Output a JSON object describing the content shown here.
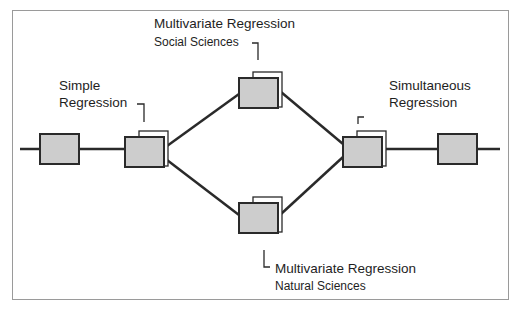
{
  "diagram": {
    "type": "flow-diagram",
    "labels": {
      "simple": {
        "line1": "Simple",
        "line2": "Regression"
      },
      "multivariate_social": {
        "line1": "Multivariate Regression",
        "line2": "Social Sciences"
      },
      "multivariate_natural": {
        "line1": "Multivariate Regression",
        "line2": "Natural Sciences"
      },
      "simultaneous": {
        "line1": "Simultaneous",
        "line2": "Regression"
      }
    },
    "nodes": [
      {
        "id": "input",
        "kind": "single"
      },
      {
        "id": "simple-regression",
        "kind": "stacked"
      },
      {
        "id": "multivariate-social",
        "kind": "stacked"
      },
      {
        "id": "multivariate-natural",
        "kind": "stacked"
      },
      {
        "id": "simultaneous-regression",
        "kind": "stacked"
      },
      {
        "id": "output",
        "kind": "single"
      }
    ],
    "edges": [
      [
        "input",
        "simple-regression"
      ],
      [
        "simple-regression",
        "multivariate-social"
      ],
      [
        "simple-regression",
        "multivariate-natural"
      ],
      [
        "multivariate-social",
        "simultaneous-regression"
      ],
      [
        "multivariate-natural",
        "simultaneous-regression"
      ],
      [
        "simultaneous-regression",
        "output"
      ]
    ],
    "colors": {
      "box_fill": "#cdcdcd",
      "stroke": "#2a2a2a",
      "frame": "#9a9a9a"
    }
  }
}
